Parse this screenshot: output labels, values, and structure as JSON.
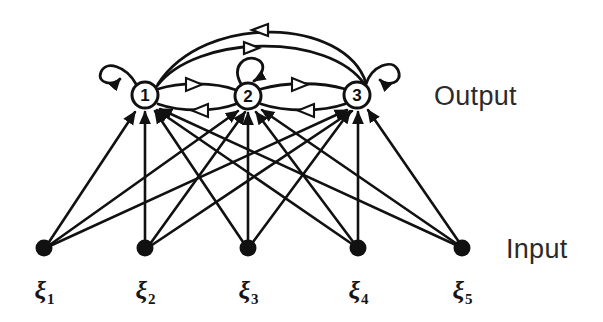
{
  "figure": {
    "type": "diagram",
    "width": 603,
    "height": 322,
    "background_color": "#ffffff",
    "ink_color": "#111111"
  },
  "layers": {
    "output": {
      "label": "Output",
      "label_position": {
        "x": 434,
        "y": 83
      },
      "node_fill": "#ffffff",
      "node_stroke": "#111111",
      "node_radius": 13,
      "nodes": [
        {
          "id": "o1",
          "label": "1",
          "x": 145,
          "y": 95
        },
        {
          "id": "o2",
          "label": "2",
          "x": 248,
          "y": 96
        },
        {
          "id": "o3",
          "label": "3",
          "x": 357,
          "y": 95
        }
      ]
    },
    "input": {
      "label": "Input",
      "label_position": {
        "x": 506,
        "y": 236
      },
      "node_fill": "#111111",
      "node_radius": 8,
      "nodes": [
        {
          "id": "i1",
          "name": "ξ",
          "subscript": "1",
          "x": 44,
          "y": 248
        },
        {
          "id": "i2",
          "name": "ξ",
          "subscript": "2",
          "x": 145,
          "y": 248
        },
        {
          "id": "i3",
          "name": "ξ",
          "subscript": "3",
          "x": 248,
          "y": 248
        },
        {
          "id": "i4",
          "name": "ξ",
          "subscript": "4",
          "x": 358,
          "y": 248
        },
        {
          "id": "i5",
          "name": "ξ",
          "subscript": "5",
          "x": 462,
          "y": 248
        }
      ],
      "name_label_y": 290
    },
    "self_loops": [
      {
        "node": "o1",
        "direction": "up-left",
        "arrowhead": "filled"
      },
      {
        "node": "o2",
        "direction": "up",
        "arrowhead": "filled"
      },
      {
        "node": "o3",
        "direction": "up-right",
        "arrowhead": "filled"
      }
    ],
    "recurrent_edges": [
      {
        "from": "o1",
        "to": "o2",
        "style": "short-arc",
        "arrowhead": "hollow-right",
        "offset": "above"
      },
      {
        "from": "o2",
        "to": "o1",
        "style": "short-arc",
        "arrowhead": "hollow-left",
        "offset": "below"
      },
      {
        "from": "o2",
        "to": "o3",
        "style": "short-arc",
        "arrowhead": "hollow-right",
        "offset": "above"
      },
      {
        "from": "o3",
        "to": "o2",
        "style": "short-arc",
        "arrowhead": "hollow-left",
        "offset": "below"
      },
      {
        "from": "o1",
        "to": "o3",
        "style": "long-arc",
        "arrowhead": "hollow-right",
        "offset": "inner"
      },
      {
        "from": "o3",
        "to": "o1",
        "style": "long-arc",
        "arrowhead": "hollow-left",
        "offset": "outer"
      }
    ],
    "feedforward_edges": [
      {
        "from": "i1",
        "to": "o1"
      },
      {
        "from": "i1",
        "to": "o2"
      },
      {
        "from": "i1",
        "to": "o3"
      },
      {
        "from": "i2",
        "to": "o1"
      },
      {
        "from": "i2",
        "to": "o2"
      },
      {
        "from": "i2",
        "to": "o3"
      },
      {
        "from": "i3",
        "to": "o1"
      },
      {
        "from": "i3",
        "to": "o2"
      },
      {
        "from": "i3",
        "to": "o3"
      },
      {
        "from": "i4",
        "to": "o1"
      },
      {
        "from": "i4",
        "to": "o2"
      },
      {
        "from": "i4",
        "to": "o3"
      },
      {
        "from": "i5",
        "to": "o1"
      },
      {
        "from": "i5",
        "to": "o2"
      },
      {
        "from": "i5",
        "to": "o3"
      }
    ]
  }
}
